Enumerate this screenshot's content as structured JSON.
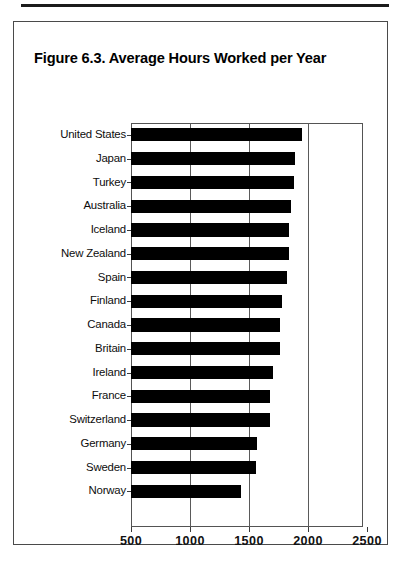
{
  "page": {
    "top_rule": "horizontal-rule"
  },
  "figure": {
    "title": "Figure 6.3.  Average Hours Worked per Year"
  },
  "chart_data": {
    "type": "bar",
    "orientation": "horizontal",
    "title": "Figure 6.3.  Average Hours Worked per Year",
    "xlabel": "",
    "ylabel": "",
    "xlim": [
      500,
      2600
    ],
    "xticks": [
      500,
      1000,
      1500,
      2000,
      2500
    ],
    "xtick_labels": [
      "500",
      "1000",
      "1500",
      "2000",
      "2500"
    ],
    "grid": "vertical gridlines at 1000, 1500, 2000",
    "gridlines": [
      1000,
      1500,
      2000
    ],
    "legend": "none",
    "bar_color": "#000000",
    "categories": [
      "United States",
      "Japan",
      "Turkey",
      "Australia",
      "Iceland",
      "New Zealand",
      "Spain",
      "Finland",
      "Canada",
      "Britain",
      "Ireland",
      "France",
      "Switzerland",
      "Germany",
      "Sweden",
      "Norway"
    ],
    "values": [
      1950,
      1890,
      1880,
      1860,
      1840,
      1840,
      1820,
      1780,
      1760,
      1760,
      1700,
      1680,
      1680,
      1570,
      1560,
      1430
    ]
  }
}
